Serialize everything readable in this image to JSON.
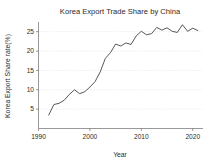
{
  "chart_data": {
    "type": "line",
    "title": "Korea Export Trade Share by China",
    "xlabel": "Year",
    "ylabel": "Korea Export Share rate(%)",
    "xlim": [
      1990,
      2022
    ],
    "ylim": [
      0,
      27.5
    ],
    "xticks": [
      1990,
      2000,
      2010,
      2020
    ],
    "xtick_labels": [
      "1990",
      "2000",
      "2010",
      "2020"
    ],
    "yticks": [
      5,
      10,
      15,
      20,
      25
    ],
    "ytick_labels": [
      "5",
      "10",
      "15",
      "20",
      "25"
    ],
    "grid": "horizontal-dotted",
    "legend": "none",
    "series": [
      {
        "name": "Korea Export Share rate(%)",
        "color": "#3a3a3a",
        "x": [
          1992,
          1993,
          1994,
          1995,
          1996,
          1997,
          1998,
          1999,
          2000,
          2001,
          2002,
          2003,
          2004,
          2005,
          2006,
          2007,
          2008,
          2009,
          2010,
          2011,
          2012,
          2013,
          2014,
          2015,
          2016,
          2017,
          2018,
          2019,
          2020,
          2021
        ],
        "values": [
          3.5,
          6.2,
          6.5,
          7.3,
          8.8,
          10.0,
          9.0,
          9.5,
          10.7,
          12.1,
          14.6,
          18.1,
          19.6,
          21.8,
          21.3,
          22.1,
          21.7,
          23.9,
          25.1,
          24.2,
          24.5,
          26.1,
          25.4,
          26.0,
          25.1,
          24.8,
          26.8,
          25.1,
          25.9,
          25.3
        ]
      }
    ]
  }
}
